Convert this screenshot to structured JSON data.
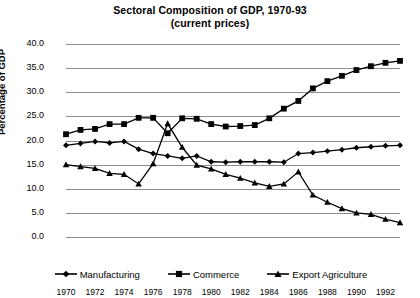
{
  "chart_data": {
    "type": "line",
    "title": "Sectoral Composition of GDP, 1970-93",
    "subtitle": "(current prices)",
    "xlabel": "",
    "ylabel": "Percentage of GDP",
    "ylim": [
      0,
      40
    ],
    "ytick_step": 5,
    "ytick_labels": [
      "40.0",
      "35.0",
      "30.0",
      "25.0",
      "20.0",
      "15.0",
      "10.0",
      "5.0",
      "0.0"
    ],
    "ytick_values": [
      40,
      35,
      30,
      25,
      20,
      15,
      10,
      5,
      0
    ],
    "xlim": [
      1970,
      1993
    ],
    "xtick_labels": [
      "1970",
      "1972",
      "1974",
      "1976",
      "1978",
      "1980",
      "1982",
      "1984",
      "1986",
      "1988",
      "1990",
      "1992"
    ],
    "xtick_values": [
      1970,
      1972,
      1974,
      1976,
      1978,
      1980,
      1982,
      1984,
      1986,
      1988,
      1990,
      1992
    ],
    "x": [
      1970,
      1971,
      1972,
      1973,
      1974,
      1975,
      1976,
      1977,
      1978,
      1979,
      1980,
      1981,
      1982,
      1983,
      1984,
      1985,
      1986,
      1987,
      1988,
      1989,
      1990,
      1991,
      1992,
      1993
    ],
    "grid": true,
    "grid_axis": "y",
    "legend_position": "bottom",
    "series": [
      {
        "name": "Manufacturing",
        "marker": "diamond",
        "color": "#000000",
        "values": [
          19.0,
          19.4,
          19.8,
          19.5,
          19.8,
          18.2,
          17.3,
          16.8,
          16.3,
          16.8,
          15.6,
          15.5,
          15.6,
          15.6,
          15.6,
          15.5,
          17.3,
          17.5,
          17.8,
          18.1,
          18.5,
          18.7,
          18.9,
          19.0
        ]
      },
      {
        "name": "Commerce",
        "marker": "square",
        "color": "#000000",
        "values": [
          21.3,
          22.2,
          22.4,
          23.4,
          23.4,
          24.7,
          24.7,
          21.5,
          24.6,
          24.5,
          23.4,
          22.9,
          23.0,
          23.2,
          24.6,
          26.6,
          28.2,
          30.8,
          32.3,
          33.4,
          34.6,
          35.4,
          36.1,
          36.5
        ]
      },
      {
        "name": "Export Agriculture",
        "marker": "triangle",
        "color": "#000000",
        "values": [
          15.0,
          14.6,
          14.2,
          13.2,
          13.0,
          11.0,
          15.2,
          23.5,
          18.6,
          14.9,
          14.1,
          13.0,
          12.2,
          11.2,
          10.5,
          11.0,
          13.5,
          8.7,
          7.2,
          5.9,
          5.0,
          4.7,
          3.7,
          3.0
        ]
      }
    ]
  }
}
